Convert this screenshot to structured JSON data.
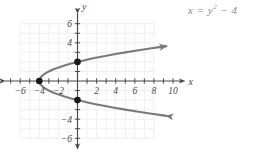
{
  "figure": {
    "equation_label": "x = y",
    "equation_exponent": "2",
    "equation_tail": " − 4",
    "equation_plain": "x = y² − 4",
    "curve_color": "#7a7a7a",
    "axis_color": "#4a4a4a",
    "grid_color": "#f0f0f0",
    "point_color": "#1a1a1a",
    "background": "#ffffff"
  },
  "axes": {
    "x_label": "x",
    "y_label": "y",
    "x_tick_labels": [
      "−6",
      "−4",
      "−2",
      "2",
      "4",
      "6",
      "8",
      "10"
    ],
    "x_tick_values": [
      -6,
      -4,
      -2,
      2,
      4,
      6,
      8,
      10
    ],
    "y_tick_labels": [
      "6",
      "4",
      "−4",
      "−6"
    ],
    "y_tick_values": [
      6,
      4,
      -4,
      -6
    ],
    "x_minor_ticks": [
      -7,
      -6,
      -5,
      -4,
      -3,
      -2,
      -1,
      1,
      2,
      3,
      4,
      5,
      6,
      7,
      8,
      9,
      10
    ],
    "y_minor_ticks": [
      -6,
      -5,
      -4,
      -3,
      -2,
      -1,
      1,
      2,
      3,
      4,
      5,
      6
    ],
    "x_range": [
      -7.6,
      11.2
    ],
    "y_range": [
      -7.1,
      7.1
    ],
    "grid_x_range": [
      -6,
      8
    ],
    "grid_y_range": [
      -6,
      6
    ],
    "grid_on": true
  },
  "chart_data": {
    "type": "line",
    "xlabel": "x",
    "ylabel": "y",
    "xlim": [
      -7.6,
      11.2
    ],
    "ylim": [
      -7.1,
      7.1
    ],
    "grid": true,
    "legend": "none",
    "series": [
      {
        "name": "x = y^2 - 4",
        "relation": "x as function of y",
        "vertex": [
          -4,
          0
        ],
        "opens": "right",
        "y_domain": [
          -3.32,
          3.32
        ],
        "arrowheads": [
          "start",
          "end"
        ],
        "points_xy": [
          [
            -4.0,
            0.0
          ],
          [
            -3.96,
            0.2
          ],
          [
            -3.84,
            0.4
          ],
          [
            -3.64,
            0.6
          ],
          [
            -3.36,
            0.8
          ],
          [
            -3.0,
            1.0
          ],
          [
            -2.56,
            1.2
          ],
          [
            -2.04,
            1.4
          ],
          [
            -1.44,
            1.6
          ],
          [
            -0.76,
            1.8
          ],
          [
            0.0,
            2.0
          ],
          [
            0.84,
            2.2
          ],
          [
            1.76,
            2.4
          ],
          [
            2.76,
            2.6
          ],
          [
            3.84,
            2.8
          ],
          [
            5.0,
            3.0
          ],
          [
            6.24,
            3.2
          ],
          [
            7.56,
            3.4
          ],
          [
            8.96,
            3.6
          ],
          [
            9.3,
            3.65
          ]
        ]
      }
    ],
    "marked_points": [
      {
        "label": "vertex",
        "x": -4,
        "y": 0
      },
      {
        "label": "y-intercept-upper",
        "x": 0,
        "y": 2
      },
      {
        "label": "y-intercept-lower",
        "x": 0,
        "y": -2
      }
    ]
  }
}
